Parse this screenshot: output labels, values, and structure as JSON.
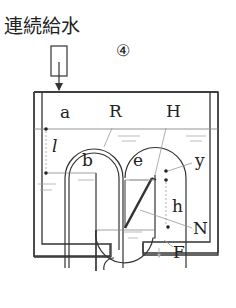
{
  "title": "連続給水",
  "figure_number": "④",
  "labels": {
    "a": "a",
    "l": "l",
    "R": "R",
    "H": "H",
    "b": "b",
    "e": "e",
    "y": "y",
    "h": "h",
    "N": "N",
    "F": "F"
  },
  "colors": {
    "stroke": "#333333",
    "water_line": "#888888",
    "leader": "#999999"
  }
}
